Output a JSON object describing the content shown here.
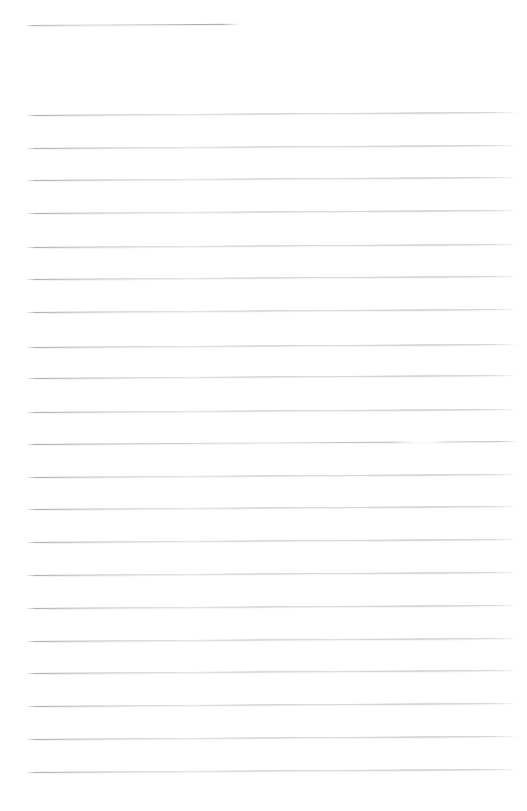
{
  "document": {
    "type": "lined-paper",
    "title": "Blank ruled page",
    "page_label": "",
    "background_color": "#ffffff",
    "rule_color": "#a8a8b2",
    "rule_color_light": "#d8d8e0",
    "canvas": {
      "width": 527,
      "height": 811
    },
    "writing_area": {
      "left": 26,
      "right": 518
    },
    "skew_degrees": -0.35,
    "line_count": 22,
    "line_spacing": 32.6,
    "rules": [
      {
        "name": "rule-1",
        "y": 25,
        "left": 26,
        "width": 214,
        "variant": "short"
      },
      {
        "name": "rule-2",
        "y": 115,
        "left": 26,
        "width": 492,
        "variant": "full"
      },
      {
        "name": "rule-3",
        "y": 148,
        "left": 26,
        "width": 492,
        "variant": "full"
      },
      {
        "name": "rule-4",
        "y": 180,
        "left": 26,
        "width": 492,
        "variant": "full"
      },
      {
        "name": "rule-5",
        "y": 213,
        "left": 26,
        "width": 492,
        "variant": "full"
      },
      {
        "name": "rule-6",
        "y": 247,
        "left": 26,
        "width": 492,
        "variant": "full"
      },
      {
        "name": "rule-7",
        "y": 279,
        "left": 26,
        "width": 492,
        "variant": "full"
      },
      {
        "name": "rule-8",
        "y": 312,
        "left": 26,
        "width": 492,
        "variant": "full"
      },
      {
        "name": "rule-9",
        "y": 347,
        "left": 26,
        "width": 492,
        "variant": "full"
      },
      {
        "name": "rule-10",
        "y": 378,
        "left": 26,
        "width": 492,
        "variant": "full"
      },
      {
        "name": "rule-11",
        "y": 412,
        "left": 26,
        "width": 492,
        "variant": "full"
      },
      {
        "name": "rule-12",
        "y": 444,
        "left": 26,
        "width": 492,
        "variant": "broken"
      },
      {
        "name": "rule-13",
        "y": 477,
        "left": 26,
        "width": 492,
        "variant": "full"
      },
      {
        "name": "rule-14",
        "y": 509,
        "left": 26,
        "width": 492,
        "variant": "full"
      },
      {
        "name": "rule-15",
        "y": 542,
        "left": 26,
        "width": 492,
        "variant": "full"
      },
      {
        "name": "rule-16",
        "y": 575,
        "left": 26,
        "width": 492,
        "variant": "full"
      },
      {
        "name": "rule-17",
        "y": 608,
        "left": 26,
        "width": 492,
        "variant": "full"
      },
      {
        "name": "rule-18",
        "y": 641,
        "left": 26,
        "width": 492,
        "variant": "full"
      },
      {
        "name": "rule-19",
        "y": 673,
        "left": 26,
        "width": 492,
        "variant": "full"
      },
      {
        "name": "rule-20",
        "y": 706,
        "left": 26,
        "width": 492,
        "variant": "full"
      },
      {
        "name": "rule-21",
        "y": 739,
        "left": 26,
        "width": 492,
        "variant": "full"
      },
      {
        "name": "rule-22",
        "y": 772,
        "left": 26,
        "width": 492,
        "variant": "full"
      }
    ]
  }
}
